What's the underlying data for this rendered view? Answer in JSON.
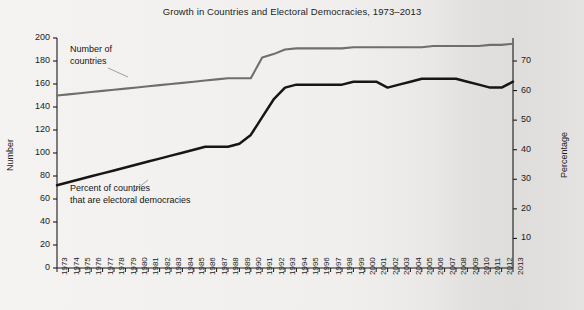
{
  "chart_data": {
    "type": "line",
    "title": "Growth in Countries and Electoral Democracies, 1973–2013",
    "xlabel": "",
    "ylabel": "Number",
    "y2label": "Percentage",
    "ylim": [
      0,
      200
    ],
    "y2lim": [
      0,
      77.78
    ],
    "yticks": [
      0,
      20,
      40,
      60,
      80,
      100,
      120,
      140,
      160,
      180,
      200
    ],
    "y2ticks": [
      10,
      20,
      30,
      40,
      50,
      60,
      70
    ],
    "grid": false,
    "legend_position": "inline-annotation",
    "x": [
      1973,
      1974,
      1975,
      1976,
      1977,
      1978,
      1979,
      1980,
      1981,
      1982,
      1983,
      1984,
      1985,
      1986,
      1987,
      1988,
      1989,
      1990,
      1991,
      1992,
      1993,
      1994,
      1995,
      1996,
      1997,
      1998,
      1999,
      2000,
      2001,
      2002,
      2003,
      2004,
      2005,
      2006,
      2007,
      2008,
      2009,
      2010,
      2011,
      2012,
      2013
    ],
    "xticklabels": [
      "1973",
      "1974",
      "1975",
      "1976",
      "1977",
      "1978",
      "1979",
      "1980",
      "1981",
      "1982",
      "1983",
      "1984",
      "1985",
      "1986",
      "1987",
      "1988",
      "1989",
      "1990",
      "1991",
      "1992",
      "1993",
      "1994",
      "1995",
      "1996",
      "1997",
      "1998",
      "1999",
      "2000",
      "2001",
      "2002",
      "2003",
      "2004",
      "2005",
      "2006",
      "2007",
      "2008",
      "2009",
      "2010",
      "2011",
      "2012",
      "2013"
    ],
    "series": [
      {
        "name": "Number of countries",
        "axis": "left",
        "color": "#6e6e6e",
        "units": "count",
        "annotation": "Number of\ncountries",
        "values": [
          150,
          151,
          152,
          153,
          154,
          155,
          156,
          157,
          158,
          159,
          160,
          161,
          162,
          163,
          164,
          165,
          165,
          165,
          183,
          186,
          190,
          191,
          191,
          191,
          191,
          191,
          192,
          192,
          192,
          192,
          192,
          192,
          192,
          193,
          193,
          193,
          193,
          193,
          194,
          194,
          195
        ]
      },
      {
        "name": "Percent of countries that are electoral democracies",
        "axis": "right",
        "color": "#161616",
        "units": "percent",
        "annotation": "Percent of countries\nthat are electoral democracies",
        "values": [
          28,
          29,
          30,
          31,
          32,
          33,
          34,
          35,
          36,
          37,
          38,
          39,
          40,
          41,
          41,
          41,
          42,
          45,
          51,
          57,
          61,
          62,
          62,
          62,
          62,
          62,
          63,
          63,
          63,
          61,
          62,
          63,
          64,
          64,
          64,
          64,
          63,
          62,
          61,
          61,
          63
        ]
      }
    ],
    "annotations": [
      {
        "name": "number-of-countries-label",
        "text_line1": "Number of",
        "text_line2": "countries"
      },
      {
        "name": "percent-democracies-label",
        "text_line1": "Percent of countries",
        "text_line2": "that are electoral democracies"
      }
    ],
    "colors": {
      "countries_line": "#6e6e6e",
      "democracies_line": "#161616",
      "axis": "#1b1b1b",
      "background": "#f1f0ee"
    }
  }
}
